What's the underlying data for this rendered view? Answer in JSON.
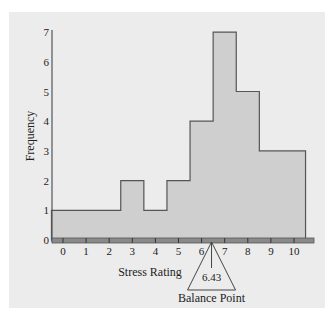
{
  "chart_data": {
    "type": "bar",
    "subtype": "histogram",
    "title": "",
    "xlabel": "Stress Rating",
    "ylabel": "Frequency",
    "categories": [
      "0",
      "1",
      "2",
      "3",
      "4",
      "5",
      "6",
      "7",
      "8",
      "9",
      "10"
    ],
    "values": [
      1,
      1,
      1,
      2,
      1,
      2,
      4,
      7,
      5,
      3,
      3
    ],
    "x_ticks": [
      "0",
      "1",
      "2",
      "3",
      "4",
      "5",
      "6",
      "7",
      "8",
      "9",
      "10"
    ],
    "y_ticks": [
      "0",
      "1",
      "2",
      "3",
      "4",
      "5",
      "6",
      "7"
    ],
    "ylim": [
      0,
      7
    ],
    "xlim": [
      -0.5,
      10.5
    ],
    "grid": false,
    "legend": null,
    "annotations": [
      {
        "type": "fulcrum-triangle",
        "x": 6.43,
        "value_label": "6.43",
        "label": "Balance Point"
      }
    ],
    "colors": {
      "bar_fill": "#cfcfcf",
      "bar_edge": "#555555",
      "axis_band": "#8a8a8a",
      "panel": "#ececec"
    }
  }
}
